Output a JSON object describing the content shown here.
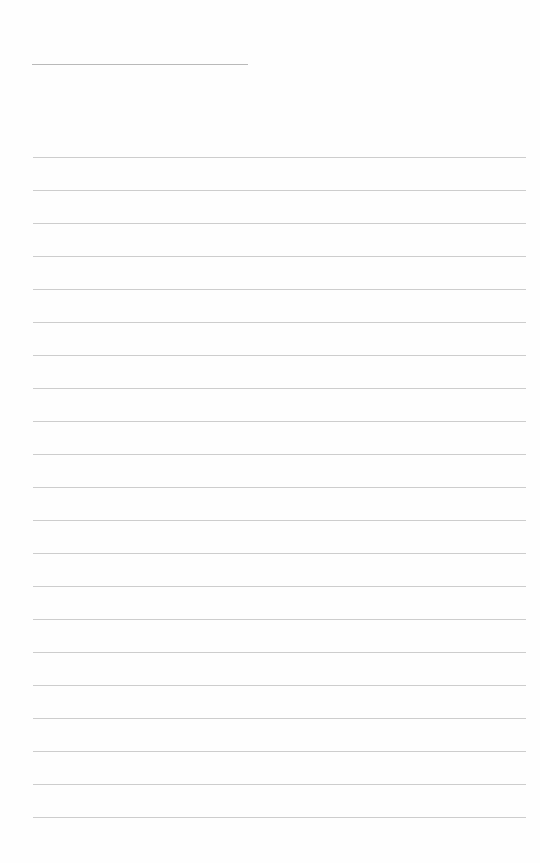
{
  "page": {
    "type": "blank lined paper",
    "title_line": {
      "present": true
    },
    "ruled_lines": {
      "count": 21,
      "first_y": 157,
      "spacing": 33,
      "color": "#cdcdcd"
    },
    "background_color": "#fefefe"
  }
}
